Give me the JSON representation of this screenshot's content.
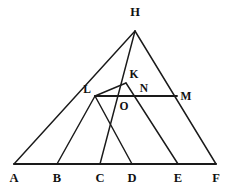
{
  "figure": {
    "stroke_color": "#1a1a1a",
    "background_color": "#ffffff",
    "labels": {
      "H": "H",
      "K": "K",
      "L": "L",
      "N": "N",
      "M": "M",
      "O": "O",
      "A": "A",
      "B": "B",
      "C": "C",
      "D": "D",
      "E": "E",
      "F": "F"
    },
    "points": {
      "H": {
        "x": 135,
        "y": 31
      },
      "K": {
        "x": 126,
        "y": 83
      },
      "L": {
        "x": 95,
        "y": 96
      },
      "N": {
        "x": 147,
        "y": 96
      },
      "M": {
        "x": 177,
        "y": 96
      },
      "O": {
        "x": 121,
        "y": 99
      },
      "A": {
        "x": 14,
        "y": 164
      },
      "B": {
        "x": 57,
        "y": 164
      },
      "C": {
        "x": 100,
        "y": 164
      },
      "D": {
        "x": 132,
        "y": 164
      },
      "E": {
        "x": 178,
        "y": 164
      },
      "F": {
        "x": 216,
        "y": 164
      }
    },
    "label_positions": {
      "H": {
        "x": 135,
        "y": 16
      },
      "K": {
        "x": 134,
        "y": 78
      },
      "L": {
        "x": 87,
        "y": 93
      },
      "N": {
        "x": 144,
        "y": 92
      },
      "M": {
        "x": 186,
        "y": 100
      },
      "O": {
        "x": 124,
        "y": 110
      },
      "A": {
        "x": 14,
        "y": 182
      },
      "B": {
        "x": 57,
        "y": 182
      },
      "C": {
        "x": 100,
        "y": 182
      },
      "D": {
        "x": 132,
        "y": 182
      },
      "E": {
        "x": 178,
        "y": 182
      },
      "F": {
        "x": 216,
        "y": 182
      }
    },
    "segments": [
      {
        "name": "base-A-F",
        "from": "A",
        "to": "F",
        "style": "base"
      },
      {
        "name": "side-H-A",
        "from": "H",
        "to": "A",
        "style": "normal"
      },
      {
        "name": "side-H-F",
        "from": "H",
        "to": "F",
        "style": "normal"
      },
      {
        "name": "cevian-H-C",
        "from": "H",
        "to": "C",
        "style": "normal"
      },
      {
        "name": "chord-L-M",
        "from": "L",
        "to": "M",
        "style": "chord"
      },
      {
        "name": "seg-L-K",
        "from": "L",
        "to": "K",
        "style": "normal"
      },
      {
        "name": "cevian-L-B",
        "from": "L",
        "to": "B",
        "style": "normal"
      },
      {
        "name": "cevian-L-D",
        "from": "L",
        "to": "D",
        "style": "normal"
      },
      {
        "name": "cevian-K-E",
        "from": "K",
        "to": "E",
        "style": "normal"
      }
    ]
  }
}
